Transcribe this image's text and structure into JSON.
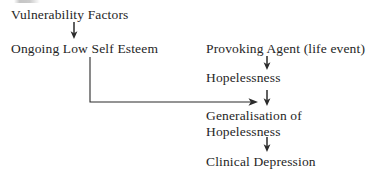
{
  "diagram": {
    "background_color": "#ffffff",
    "text_color": "#262626",
    "line_color": "#2b2b2b",
    "nodes": [
      {
        "id": "vulnerability-factors",
        "label": "Vulnerability Factors",
        "x": 11,
        "y": 7
      },
      {
        "id": "ongoing-low-self-esteem",
        "label": "Ongoing Low Self Esteem",
        "x": 11,
        "y": 41
      },
      {
        "id": "provoking-agent",
        "label": "Provoking Agent (life event)",
        "x": 206,
        "y": 41
      },
      {
        "id": "hopelessness",
        "label": "Hopelessness",
        "x": 206,
        "y": 70
      },
      {
        "id": "generalisation-of-hopelessness",
        "label": "Generalisation of Hopelessness",
        "x": 206,
        "y": 108
      },
      {
        "id": "clinical-depression",
        "label": "Clinical Depression",
        "x": 206,
        "y": 154
      }
    ],
    "arrows": [
      {
        "id": "arrow-vulnerability-to-esteem",
        "type": "vertical-down",
        "x": 74,
        "y1": 22,
        "y2": 38
      },
      {
        "id": "arrow-provoking-to-hopelessness",
        "type": "vertical-down",
        "x": 267,
        "y1": 56,
        "y2": 69
      },
      {
        "id": "arrow-hopelessness-to-generalisation",
        "type": "vertical-down",
        "x": 267,
        "y1": 90,
        "y2": 105
      },
      {
        "id": "arrow-generalisation-to-depression",
        "type": "vertical-down",
        "x": 267,
        "y1": 137,
        "y2": 151
      },
      {
        "id": "arrow-esteem-elbow-to-generalisation",
        "type": "elbow-right",
        "x": 90,
        "y1": 57,
        "y2": 102,
        "x2": 258
      }
    ]
  }
}
